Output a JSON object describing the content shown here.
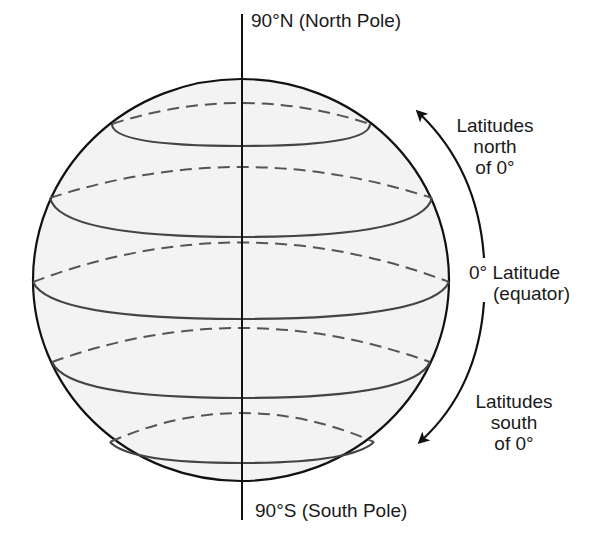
{
  "diagram": {
    "labels": {
      "north_pole": "90°N (North Pole)",
      "south_pole": "90°S (South Pole)",
      "north_annotation": [
        "Latitudes",
        "north",
        "of 0°"
      ],
      "south_annotation": [
        "Latitudes",
        "south",
        "of 0°"
      ],
      "equator_line1": "0° Latitude",
      "equator_line2": "(equator)"
    },
    "colors": {
      "sphere_fill": "#f3f3f3",
      "outline": "#111111",
      "latitude_front": "#444444",
      "latitude_back": "#555555"
    },
    "sphere": {
      "cx": 241,
      "cy": 280,
      "rx": 208,
      "ry": 201
    },
    "axis": {
      "x": 242,
      "y_top": 14,
      "y_bottom": 520
    },
    "latitudes": [
      {
        "name": "high-north",
        "y_back": 103,
        "y_front": 146,
        "half_width": 130
      },
      {
        "name": "mid-north",
        "y_back": 167,
        "y_front": 237,
        "half_width": 192
      },
      {
        "name": "equator",
        "y_back": 242,
        "y_front": 319,
        "half_width": 208
      },
      {
        "name": "mid-south",
        "y_back": 328,
        "y_front": 398,
        "half_width": 190
      },
      {
        "name": "high-south",
        "y_back": 412,
        "y_front": 463,
        "half_width": 132
      }
    ]
  }
}
